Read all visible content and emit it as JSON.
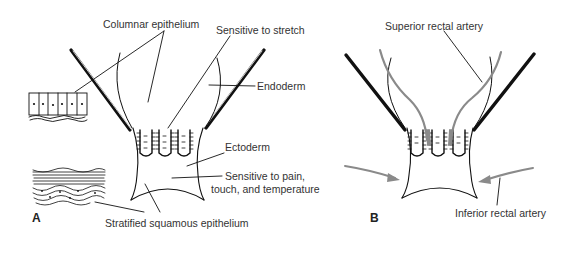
{
  "figure": {
    "panel_a": {
      "letter": "A",
      "labels": {
        "columnar_epithelium": "Columnar epithelium",
        "sensitive_to_stretch": "Sensitive to stretch",
        "endoderm": "Endoderm",
        "ectoderm": "Ectoderm",
        "sensitive_pain_line1": "Sensitive to pain,",
        "sensitive_pain_line2": "touch, and temperature",
        "stratified_squamous": "Stratified squamous epithelium"
      }
    },
    "panel_b": {
      "letter": "B",
      "labels": {
        "superior_rectal_artery": "Superior rectal artery",
        "inferior_rectal_artery": "Inferior rectal artery"
      }
    },
    "colors": {
      "line": "#111111",
      "artery": "#8a8a8a",
      "text": "#333333"
    }
  }
}
